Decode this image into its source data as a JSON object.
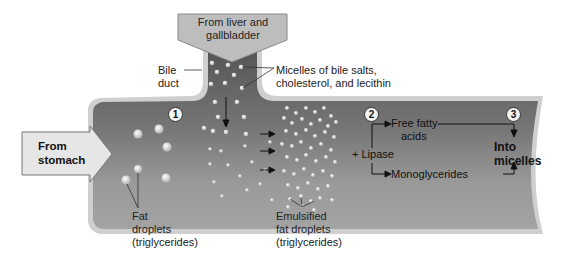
{
  "diagram": {
    "title_top": "From liver and gallbladder",
    "labels": {
      "from_liver_line1": "From liver and",
      "from_liver_line2": "gallbladder",
      "bile_duct_line1": "Bile",
      "bile_duct_line2": "duct",
      "micelles_line1": "Micelles of bile salts,",
      "micelles_line2": "cholesterol, and lecithin",
      "from_stomach_line1": "From",
      "from_stomach_line2": "stomach",
      "fat_droplets_line1": "Fat",
      "fat_droplets_line2": "droplets",
      "fat_droplets_line3": "(triglycerides)",
      "emulsified_line1": "Emulsified",
      "emulsified_line2": "fat droplets",
      "emulsified_line3": "(triglycerides)",
      "lipase": "+ Lipase",
      "free_fatty_line1": "Free fatty",
      "free_fatty_line2": "acids",
      "monoglycerides": "Monoglycerides",
      "into_micelles_line1": "Into",
      "into_micelles_line2": "micelles"
    },
    "steps": [
      "1",
      "2",
      "3"
    ],
    "colors": {
      "intestine_dark": "#5e5e5e",
      "intestine_light": "#a8a8a8",
      "wall": "#c9c9c9",
      "arrow_box": "#bdbdbd"
    }
  }
}
